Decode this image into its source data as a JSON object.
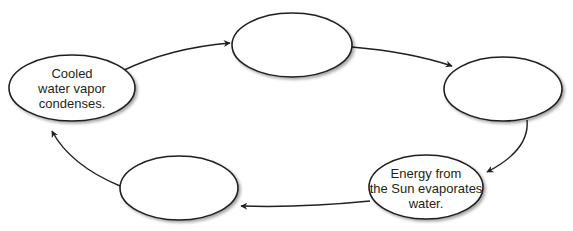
{
  "diagram": {
    "type": "cycle",
    "stroke_color": "#231f20",
    "fill_color": "#ffffff",
    "nodes": [
      {
        "id": "left",
        "lines": [
          "Cooled",
          "water vapor",
          "condenses."
        ]
      },
      {
        "id": "top",
        "lines": []
      },
      {
        "id": "right",
        "lines": []
      },
      {
        "id": "bottom-right",
        "lines": [
          "Energy from",
          "the Sun evaporates",
          "water."
        ]
      },
      {
        "id": "bottom-left",
        "lines": []
      }
    ],
    "edges": [
      {
        "from": "left",
        "to": "top"
      },
      {
        "from": "top",
        "to": "right"
      },
      {
        "from": "right",
        "to": "bottom-right"
      },
      {
        "from": "bottom-right",
        "to": "bottom-left"
      },
      {
        "from": "bottom-left",
        "to": "left"
      }
    ]
  }
}
